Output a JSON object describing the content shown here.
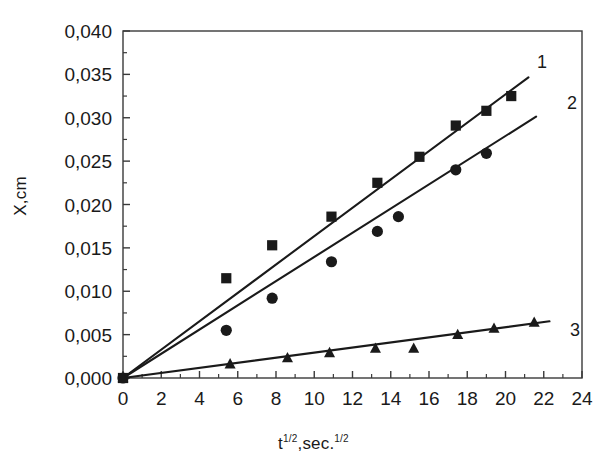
{
  "chart_data": {
    "type": "scatter",
    "title": "",
    "xlabel": "t^(1/2), sec.^(1/2)",
    "ylabel": "X,cm",
    "xlim": [
      0,
      24
    ],
    "ylim": [
      0,
      0.04
    ],
    "xticks": [
      0,
      2,
      4,
      6,
      8,
      10,
      12,
      14,
      16,
      18,
      20,
      22,
      24
    ],
    "xtick_labels": [
      "0",
      "2",
      "4",
      "6",
      "8",
      "10",
      "12",
      "14",
      "16",
      "18",
      "20",
      "22",
      "24"
    ],
    "yticks": [
      0.0,
      0.005,
      0.01,
      0.015,
      0.02,
      0.025,
      0.03,
      0.035,
      0.04
    ],
    "ytick_labels": [
      "0,000",
      "0,005",
      "0,010",
      "0,015",
      "0,020",
      "0,025",
      "0,030",
      "0,035",
      "0,040"
    ],
    "decimal_separator": ",",
    "minor_ticks": true,
    "grid": false,
    "legend": "inline-end-labels",
    "frame": "box",
    "series": [
      {
        "name": "1",
        "label": "1",
        "marker": "square",
        "color": "#1a1a1a",
        "fit_slope": 0.001635,
        "fit_intercept": 0.0,
        "fit_x_range": [
          0,
          21.2
        ],
        "points": [
          {
            "x": 0.0,
            "y": 0.0
          },
          {
            "x": 5.4,
            "y": 0.0115
          },
          {
            "x": 7.8,
            "y": 0.0153
          },
          {
            "x": 10.9,
            "y": 0.0186
          },
          {
            "x": 13.3,
            "y": 0.0225
          },
          {
            "x": 15.5,
            "y": 0.0255
          },
          {
            "x": 17.4,
            "y": 0.0291
          },
          {
            "x": 19.0,
            "y": 0.0308
          },
          {
            "x": 20.3,
            "y": 0.0325
          }
        ]
      },
      {
        "name": "2",
        "label": "2",
        "marker": "circle",
        "color": "#1a1a1a",
        "fit_slope": 0.001395,
        "fit_intercept": 0.0,
        "fit_x_range": [
          0,
          21.6
        ],
        "points": [
          {
            "x": 0.0,
            "y": 0.0
          },
          {
            "x": 5.4,
            "y": 0.0055
          },
          {
            "x": 7.8,
            "y": 0.0092
          },
          {
            "x": 10.9,
            "y": 0.0134
          },
          {
            "x": 13.3,
            "y": 0.0169
          },
          {
            "x": 14.4,
            "y": 0.0186
          },
          {
            "x": 17.4,
            "y": 0.024
          },
          {
            "x": 19.0,
            "y": 0.0259
          }
        ]
      },
      {
        "name": "3",
        "label": "3",
        "marker": "triangle",
        "color": "#1a1a1a",
        "fit_slope": 0.000293,
        "fit_intercept": 0.0,
        "fit_x_range": [
          0,
          22.3
        ],
        "points": [
          {
            "x": 0.0,
            "y": 0.0
          },
          {
            "x": 5.6,
            "y": 0.0016
          },
          {
            "x": 8.6,
            "y": 0.0023
          },
          {
            "x": 10.8,
            "y": 0.0029
          },
          {
            "x": 13.2,
            "y": 0.0034
          },
          {
            "x": 15.2,
            "y": 0.0034
          },
          {
            "x": 17.5,
            "y": 0.005
          },
          {
            "x": 19.4,
            "y": 0.0057
          },
          {
            "x": 21.5,
            "y": 0.0064
          }
        ]
      }
    ]
  },
  "annotations": {
    "series1_tag": "1",
    "series2_tag": "2",
    "series3_tag": "3"
  },
  "axis_titles": {
    "y": "X,cm",
    "x_base": "t",
    "x_exp": "1/2",
    "x_mid": ",sec.",
    "x_exp2": "1/2"
  }
}
